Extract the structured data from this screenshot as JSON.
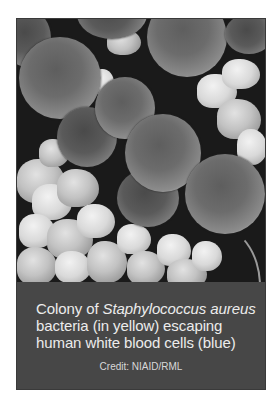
{
  "figure": {
    "photo": {
      "description": "Scanning electron micrograph of spherical Staphylococcus aureus bacteria among clustered white blood cell debris",
      "tone": "grayscale"
    },
    "caption": {
      "line1_prefix": "Colony of ",
      "line1_species": "Staphylococcus aureus",
      "line2": "bacteria (in yellow) escaping",
      "line3": "human white blood cells (blue)"
    },
    "credit": "Credit: NIAID/RML"
  },
  "colors": {
    "caption_background": "#474747",
    "caption_text": "#ececec",
    "photo_background": "#1a1a1a",
    "page_background": "#ffffff"
  }
}
